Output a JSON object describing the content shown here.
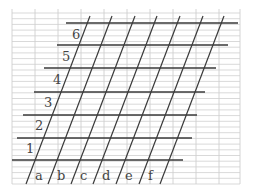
{
  "diagram": {
    "type": "oblique grid on lined paper",
    "colors": {
      "grid": "#cfcfcf",
      "ink": "#3a3a3a",
      "label": "#444444"
    },
    "grid": {
      "x_left": 12,
      "x_right": 240,
      "y_top": 13,
      "y_bottom": 184,
      "vertical_x": [
        12,
        35,
        58,
        81,
        104,
        127,
        150,
        173,
        196,
        219,
        240
      ],
      "minor_spacing": 5.7
    },
    "row_lines": [
      {
        "label": "6",
        "y": 23,
        "x1": 66,
        "x2": 238,
        "label_x": 72,
        "label_y": 39
      },
      {
        "label": "5",
        "y": 45,
        "x1": 57,
        "x2": 228,
        "label_x": 62,
        "label_y": 61
      },
      {
        "label": "4",
        "y": 68,
        "x1": 44,
        "x2": 216,
        "label_x": 53,
        "label_y": 84
      },
      {
        "label": "3",
        "y": 92,
        "x1": 34,
        "x2": 205,
        "label_x": 44,
        "label_y": 107
      },
      {
        "label": "2",
        "y": 115,
        "x1": 23,
        "x2": 197,
        "label_x": 35,
        "label_y": 130
      },
      {
        "label": "1",
        "y": 138,
        "x1": 17,
        "x2": 192,
        "label_x": 26,
        "label_y": 153
      },
      {
        "label": "",
        "y": 160,
        "x1": 12,
        "x2": 183
      }
    ],
    "slant_lines": [
      {
        "x_bottom": 26,
        "y_bottom": 184,
        "x_top": 90,
        "y_top": 16
      },
      {
        "x_bottom": 48,
        "y_bottom": 184,
        "x_top": 112,
        "y_top": 16
      },
      {
        "x_bottom": 71,
        "y_bottom": 184,
        "x_top": 135,
        "y_top": 16
      },
      {
        "x_bottom": 93,
        "y_bottom": 184,
        "x_top": 157,
        "y_top": 16
      },
      {
        "x_bottom": 116,
        "y_bottom": 184,
        "x_top": 180,
        "y_top": 16
      },
      {
        "x_bottom": 139,
        "y_bottom": 184,
        "x_top": 203,
        "y_top": 16
      },
      {
        "x_bottom": 160,
        "y_bottom": 184,
        "x_top": 224,
        "y_top": 16
      }
    ],
    "column_labels": [
      {
        "label": "a",
        "x": 35,
        "y": 180
      },
      {
        "label": "b",
        "x": 57,
        "y": 180
      },
      {
        "label": "c",
        "x": 80,
        "y": 180
      },
      {
        "label": "d",
        "x": 102,
        "y": 180
      },
      {
        "label": "e",
        "x": 125,
        "y": 180
      },
      {
        "label": "f",
        "x": 148,
        "y": 180
      }
    ]
  }
}
